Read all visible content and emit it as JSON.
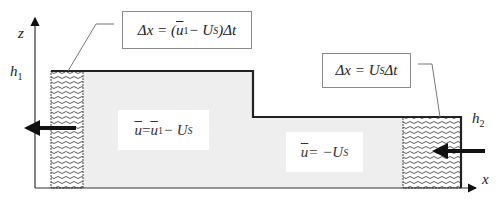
{
  "axes": {
    "x_label": "x",
    "z_label": "z",
    "h1_label": "h",
    "h1_sub": "1",
    "h2_label": "h",
    "h2_sub": "2"
  },
  "annotations": {
    "left_box": {
      "delta": "Δx = (",
      "u": "u",
      "u_sub": "1",
      "minus": " − U",
      "us_sub": "S",
      "tail": ")Δt"
    },
    "right_box": {
      "delta": "Δx = U",
      "us_sub": "S",
      "tail": "Δt"
    }
  },
  "regions": {
    "upstream_label": {
      "u": "u",
      "eq": " = ",
      "u1": "u",
      "u1_sub": "1",
      "minus": " − U",
      "us_sub": "S"
    },
    "downstream_label": {
      "u": "u",
      "eq": " = −U",
      "us_sub": "S"
    }
  },
  "colors": {
    "fluid_fill": "#eeeeee",
    "outline": "#222222",
    "hatch": "#333333",
    "leader": "#777777"
  }
}
